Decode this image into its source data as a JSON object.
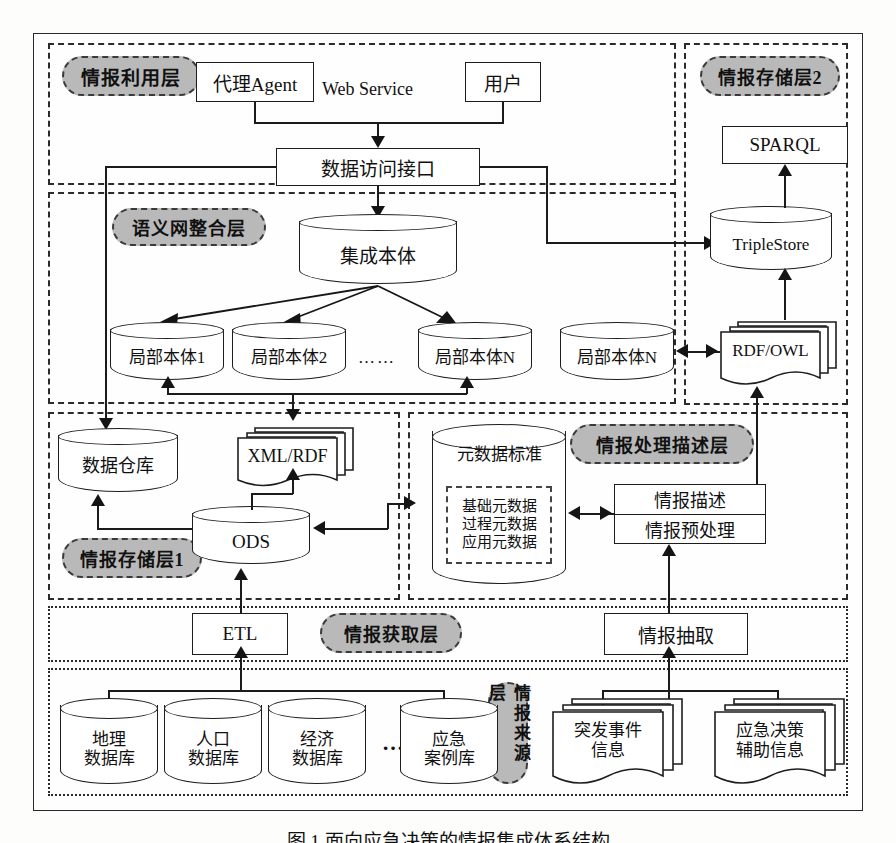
{
  "figure": {
    "caption": "图 1  面向应急决策的情报集成体系结构"
  },
  "layers": {
    "utilization": {
      "label": "情报利用层"
    },
    "storage2": {
      "label": "情报存储层2"
    },
    "semantic": {
      "label": "语义网整合层"
    },
    "storage1": {
      "label": "情报存储层1"
    },
    "processing": {
      "label": "情报处理描述层"
    },
    "acquisition": {
      "label": "情报获取层"
    },
    "source": {
      "label": "情报来源层"
    }
  },
  "nodes": {
    "agent": "代理Agent",
    "user": "用户",
    "web_service": "Web Service",
    "data_access_api": "数据访问接口",
    "sparql": "SPARQL",
    "triplestore": "TripleStore",
    "integrated_ontology": "集成本体",
    "local_ontology_1": "局部本体1",
    "local_ontology_2": "局部本体2",
    "local_ontology_ellipsis": "……",
    "local_ontology_n": "局部本体N",
    "local_ontology_n2": "局部本体N",
    "rdf_owl": "RDF/OWL",
    "data_warehouse": "数据仓库",
    "xml_rdf": "XML/RDF",
    "ods": "ODS",
    "metadata_standard": "元数据标准",
    "metadata_items": [
      "基础元数据",
      "过程元数据",
      "应用元数据"
    ],
    "intel_description": "情报描述",
    "intel_preprocess": "情报预处理",
    "etl": "ETL",
    "intel_extraction": "情报抽取",
    "db_geo": "地理\n数据库",
    "db_population": "人口\n数据库",
    "db_economy": "经济\n数据库",
    "db_ellipsis": "…",
    "db_emergency_cases": "应急\n案例库",
    "doc_incident": "突发事件\n信息",
    "doc_decision_support": "应急决策\n辅助信息"
  },
  "colors": {
    "pill_fill": "#b9b9b9",
    "stroke": "#1d1d1d",
    "background": "#fdfdfc"
  }
}
